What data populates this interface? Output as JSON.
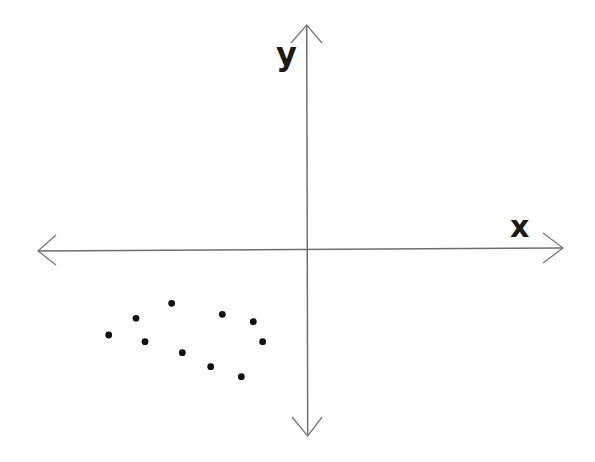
{
  "diagram": {
    "type": "cartesian-axes-scatter",
    "axes": {
      "x_label": "x",
      "y_label": "y",
      "origin_px": [
        306.7,
        249.3
      ],
      "x_axis": {
        "left_tip_px": [
          38,
          251
        ],
        "right_tip_px": [
          563,
          248
        ]
      },
      "y_axis": {
        "top_tip_px": [
          306.7,
          25
        ],
        "bottom_tip_px": [
          307.7,
          436
        ]
      },
      "arrows": "both-ends",
      "line_color": "#6e6e6e"
    },
    "points_quadrant": "III",
    "point_color": "#111111",
    "points_px": [
      [
        108.7,
        335.0
      ],
      [
        136.0,
        318.3
      ],
      [
        171.7,
        303.3
      ],
      [
        145.0,
        341.7
      ],
      [
        182.3,
        352.7
      ],
      [
        222.3,
        314.3
      ],
      [
        253.3,
        321.7
      ],
      [
        262.7,
        341.7
      ],
      [
        210.7,
        366.7
      ],
      [
        241.3,
        376.7
      ]
    ],
    "point_count": 10
  }
}
